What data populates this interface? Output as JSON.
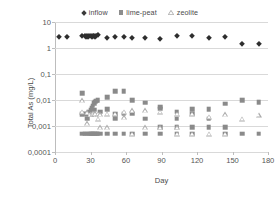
{
  "chart_data": {
    "type": "scatter",
    "title": "",
    "xlabel": "Day",
    "ylabel": "Total As (mg/L)",
    "yscale": "log",
    "ylim": [
      0.0001,
      10
    ],
    "xlim": [
      0,
      180
    ],
    "grid": true,
    "legend_position": "top-center",
    "xticks": [
      "0",
      "30",
      "60",
      "90",
      "120",
      "150",
      "180"
    ],
    "xtick_values": [
      0,
      30,
      60,
      90,
      120,
      150,
      180
    ],
    "yticks": [
      "10",
      "1",
      "0,1",
      "0,01",
      "0,001",
      "0,0001"
    ],
    "ytick_values": [
      10,
      1,
      0.1,
      0.01,
      0.001,
      0.0001
    ],
    "series": [
      {
        "name": "inflow",
        "marker": "diamond",
        "color": "#2e2e2e",
        "points": [
          [
            3,
            2.6
          ],
          [
            10,
            2.7
          ],
          [
            23,
            2.8
          ],
          [
            25,
            2.85
          ],
          [
            26,
            2.7
          ],
          [
            27,
            2.9
          ],
          [
            28,
            2.75
          ],
          [
            29,
            2.8
          ],
          [
            30,
            2.85
          ],
          [
            31,
            2.7
          ],
          [
            32,
            2.8
          ],
          [
            33,
            2.9
          ],
          [
            34,
            2.75
          ],
          [
            35,
            2.85
          ],
          [
            36,
            3.1
          ],
          [
            44,
            2.5
          ],
          [
            51,
            2.6
          ],
          [
            58,
            2.7
          ],
          [
            65,
            2.4
          ],
          [
            76,
            2.4
          ],
          [
            89,
            2.2
          ],
          [
            103,
            3.0
          ],
          [
            116,
            2.8
          ],
          [
            130,
            2.4
          ],
          [
            144,
            2.6
          ],
          [
            158,
            1.4
          ],
          [
            172,
            1.4
          ]
        ]
      },
      {
        "name": "lime-peat",
        "marker": "square",
        "color": "#8a8a8a",
        "points": [
          [
            23,
            0.018
          ],
          [
            23,
            0.0028
          ],
          [
            23,
            0.0005
          ],
          [
            25,
            0.003
          ],
          [
            25,
            0.0005
          ],
          [
            27,
            0.0028
          ],
          [
            27,
            0.0019
          ],
          [
            27,
            0.0005
          ],
          [
            29,
            0.0034
          ],
          [
            29,
            0.0005
          ],
          [
            30,
            0.0042
          ],
          [
            30,
            0.003
          ],
          [
            30,
            0.0005
          ],
          [
            31,
            0.005
          ],
          [
            31,
            0.0033
          ],
          [
            31,
            0.0005
          ],
          [
            32,
            0.006
          ],
          [
            32,
            0.0038
          ],
          [
            32,
            0.0005
          ],
          [
            33,
            0.0075
          ],
          [
            33,
            0.0042
          ],
          [
            33,
            0.0005
          ],
          [
            34,
            0.0085
          ],
          [
            34,
            0.0005
          ],
          [
            35,
            0.0095
          ],
          [
            35,
            0.0005
          ],
          [
            36,
            0.0098
          ],
          [
            36,
            0.0005
          ],
          [
            38,
            0.0035
          ],
          [
            38,
            0.0005
          ],
          [
            44,
            0.0125
          ],
          [
            44,
            0.0045
          ],
          [
            44,
            0.0005
          ],
          [
            51,
            0.022
          ],
          [
            51,
            0.0028
          ],
          [
            51,
            0.0019
          ],
          [
            51,
            0.0005
          ],
          [
            58,
            0.022
          ],
          [
            58,
            0.003
          ],
          [
            58,
            0.0005
          ],
          [
            65,
            0.0096
          ],
          [
            65,
            0.003
          ],
          [
            65,
            0.0005
          ],
          [
            76,
            0.008
          ],
          [
            76,
            0.0019
          ],
          [
            76,
            0.0005
          ],
          [
            89,
            0.0055
          ],
          [
            89,
            0.0046
          ],
          [
            89,
            0.0009
          ],
          [
            89,
            0.0005
          ],
          [
            103,
            0.0036
          ],
          [
            103,
            0.0019
          ],
          [
            103,
            0.0009
          ],
          [
            103,
            0.0005
          ],
          [
            116,
            0.0045
          ],
          [
            116,
            0.003
          ],
          [
            116,
            0.0009
          ],
          [
            116,
            0.0005
          ],
          [
            130,
            0.0044
          ],
          [
            130,
            0.0019
          ],
          [
            130,
            0.0009
          ],
          [
            144,
            0.0072
          ],
          [
            144,
            0.0009
          ],
          [
            144,
            0.0005
          ],
          [
            158,
            0.0098
          ],
          [
            158,
            0.0005
          ],
          [
            172,
            0.0082
          ],
          [
            172,
            0.0005
          ]
        ]
      },
      {
        "name": "zeolite",
        "marker": "triangle-open",
        "color": "#a9a9a9",
        "points": [
          [
            23,
            0.0098
          ],
          [
            23,
            0.0036
          ],
          [
            27,
            0.0034
          ],
          [
            27,
            0.0013
          ],
          [
            30,
            0.003
          ],
          [
            30,
            0.0028
          ],
          [
            32,
            0.0032
          ],
          [
            32,
            0.003
          ],
          [
            34,
            0.0031
          ],
          [
            36,
            0.003
          ],
          [
            36,
            0.0019
          ],
          [
            38,
            0.0028
          ],
          [
            38,
            0.0009
          ],
          [
            44,
            0.003
          ],
          [
            44,
            0.0009
          ],
          [
            51,
            0.003
          ],
          [
            58,
            0.0036
          ],
          [
            58,
            0.0022
          ],
          [
            65,
            0.004
          ],
          [
            65,
            0.0005
          ],
          [
            76,
            0.004
          ],
          [
            76,
            0.0009
          ],
          [
            89,
            0.0036
          ],
          [
            89,
            0.0009
          ],
          [
            103,
            0.003
          ],
          [
            103,
            0.0009
          ],
          [
            103,
            0.0005
          ],
          [
            116,
            0.003
          ],
          [
            116,
            0.0005
          ],
          [
            130,
            0.0023
          ],
          [
            130,
            0.0005
          ],
          [
            144,
            0.0028
          ],
          [
            144,
            0.0005
          ],
          [
            158,
            0.0019
          ],
          [
            172,
            0.0027
          ]
        ]
      }
    ]
  },
  "legend": {
    "items": [
      {
        "label": "inflow",
        "marker": "diamond-icon"
      },
      {
        "label": "lime-peat",
        "marker": "square-icon"
      },
      {
        "label": "zeolite",
        "marker": "triangle-icon"
      }
    ]
  }
}
